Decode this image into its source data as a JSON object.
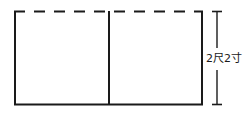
{
  "figure": {
    "type": "geometry-diagram",
    "background_color": "#ffffff",
    "stroke_color": "#1a1a1a",
    "rectangle": {
      "x": 14,
      "y": 11,
      "width": 189,
      "height": 94,
      "top_edge_style": "dashed",
      "left_edge_style": "solid",
      "right_edge_style": "solid",
      "bottom_edge_style": "solid",
      "dash_pattern": "11 9"
    },
    "divider": {
      "orientation": "vertical",
      "x": 109,
      "y_top": 11,
      "y_bottom": 105,
      "style": "solid"
    },
    "dimension": {
      "orientation": "vertical",
      "x": 217,
      "y_top": 11,
      "y_bottom": 105,
      "tick_half_width": 5,
      "label": "2尺2寸",
      "label_parts": {
        "value_1": "2",
        "unit_1": "尺",
        "value_2": "2",
        "unit_2": "寸"
      }
    }
  }
}
